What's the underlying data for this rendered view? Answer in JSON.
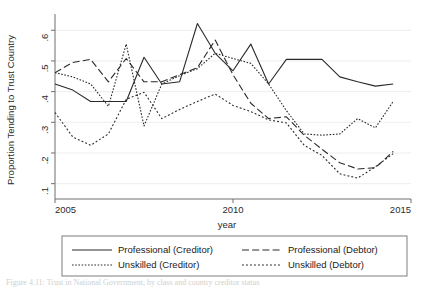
{
  "figure": {
    "caption_partial": "Figure 4.11: Trust in National Government, by class and country creditor status",
    "background": "#ffffff",
    "line_color": "#2a2a2a",
    "grid_color": "#e8e8e8",
    "axis_color": "#6f6f6f"
  },
  "chart_data": {
    "type": "line",
    "title": "",
    "xlabel": "year",
    "ylabel": "Proportion Tending to Trust Country",
    "xlim": [
      2005,
      2015
    ],
    "ylim": [
      0.05,
      0.64
    ],
    "xticks": [
      2005,
      2010,
      2015
    ],
    "xticklabels": [
      "2005",
      "2010",
      "2015"
    ],
    "yticks": [
      0.1,
      0.2,
      0.3,
      0.4,
      0.5,
      0.6
    ],
    "yticklabels": [
      ".1",
      ".2",
      ".3",
      ".4",
      ".5",
      ".6"
    ],
    "grid": "horizontal",
    "legend_position": "below-axes",
    "x": [
      2005,
      2005.5,
      2006,
      2006.5,
      2007,
      2007.5,
      2008,
      2008.5,
      2009,
      2009.5,
      2010,
      2010.5,
      2011,
      2011.5,
      2012,
      2012.5,
      2013,
      2013.5,
      2014,
      2014.5
    ],
    "series": [
      {
        "name": "Professional (Creditor)",
        "style": "solid",
        "values": [
          0.425,
          0.405,
          0.368,
          0.368,
          0.368,
          0.512,
          0.425,
          0.432,
          0.622,
          0.525,
          0.468,
          0.555,
          0.425,
          0.505,
          0.505,
          0.505,
          0.448,
          0.432,
          0.418,
          0.425
        ]
      },
      {
        "name": "Professional (Debtor)",
        "style": "dashed",
        "values": [
          0.462,
          0.495,
          0.505,
          0.432,
          0.508,
          0.432,
          0.432,
          0.455,
          0.478,
          0.568,
          0.455,
          0.362,
          0.312,
          0.318,
          0.258,
          0.212,
          0.168,
          0.148,
          0.152,
          0.205
        ]
      },
      {
        "name": "Unskilled (Creditor)",
        "style": "dotted-fine",
        "values": [
          0.462,
          0.448,
          0.425,
          0.352,
          0.555,
          0.288,
          0.425,
          0.452,
          0.475,
          0.525,
          0.508,
          0.492,
          0.425,
          0.338,
          0.262,
          0.258,
          0.262,
          0.312,
          0.282,
          0.368
        ]
      },
      {
        "name": "Unskilled (Debtor)",
        "style": "dotted",
        "values": [
          0.332,
          0.252,
          0.225,
          0.262,
          0.375,
          0.398,
          0.312,
          0.342,
          0.368,
          0.392,
          0.355,
          0.335,
          0.308,
          0.298,
          0.225,
          0.192,
          0.132,
          0.118,
          0.155,
          0.198
        ]
      }
    ]
  },
  "legend": {
    "entries": [
      {
        "label": "Professional (Creditor)",
        "style": "solid"
      },
      {
        "label": "Professional (Debtor)",
        "style": "dashed"
      },
      {
        "label": "Unskilled (Creditor)",
        "style": "dotted-fine"
      },
      {
        "label": "Unskilled (Debtor)",
        "style": "dotted"
      }
    ]
  }
}
